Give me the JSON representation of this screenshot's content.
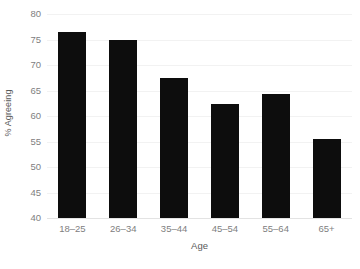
{
  "chart_data": {
    "type": "bar",
    "title": "",
    "subtitle": "",
    "xlabel": "Age",
    "ylabel": "% Agreeing",
    "categories": [
      "18–25",
      "26–34",
      "35–44",
      "45–54",
      "55–64",
      "65+"
    ],
    "values": [
      76.5,
      75.0,
      67.4,
      62.3,
      64.4,
      55.5
    ],
    "series": [
      {
        "name": "% Agreeing",
        "values": [
          76.5,
          75.0,
          67.4,
          62.3,
          64.4,
          55.5
        ]
      }
    ],
    "ylim": [
      40,
      80
    ],
    "yticks": [
      40,
      45,
      50,
      55,
      60,
      65,
      70,
      75,
      80
    ],
    "ytick_labels": [
      "40",
      "45",
      "50",
      "55",
      "60",
      "65",
      "70",
      "75",
      "80"
    ],
    "xlim_categories": 6,
    "grid": "horizontal",
    "legend": "none",
    "annotations": [],
    "colors": {
      "bar": "#0d0d0d",
      "gridline": "#f2f2f2",
      "axis_line": "#e3e3e3",
      "tick_label": "#808080",
      "axis_title": "#595959",
      "background": "#ffffff"
    }
  }
}
